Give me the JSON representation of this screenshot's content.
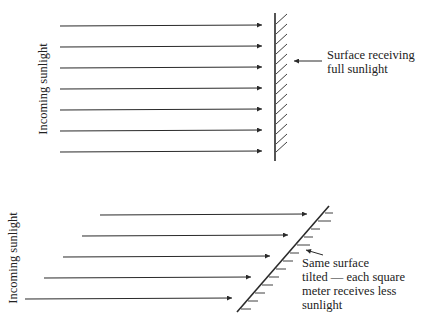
{
  "top_panel": {
    "side_label": "Incoming sunlight",
    "surface_label_line1": "Surface receiving",
    "surface_label_line2": "full sunlight",
    "ray_count": 7,
    "surface_orientation": "perpendicular"
  },
  "bottom_panel": {
    "side_label": "Incoming sunlight",
    "surface_label_line1": "Same surface",
    "surface_label_line2": "tilted — each square",
    "surface_label_line3": "meter receives less",
    "surface_label_line4": "sunlight",
    "ray_count": 5,
    "surface_orientation": "tilted"
  },
  "colors": {
    "line": "#2a2a2a",
    "background": "#ffffff"
  }
}
